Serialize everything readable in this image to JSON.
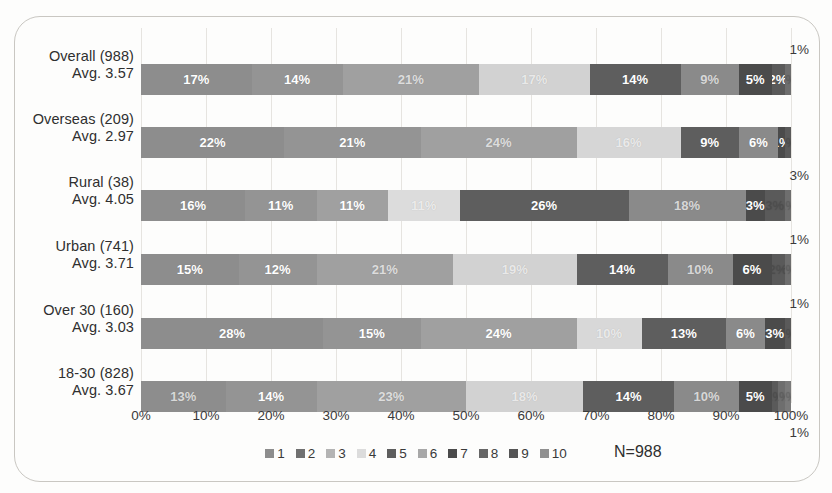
{
  "chart_data": {
    "type": "bar",
    "subtype": "100% stacked horizontal bar",
    "title": "",
    "xlabel": "",
    "ylabel": "",
    "xlim": [
      0,
      100
    ],
    "xticks": [
      "0%",
      "10%",
      "20%",
      "30%",
      "40%",
      "50%",
      "60%",
      "70%",
      "80%",
      "90%",
      "100%"
    ],
    "grid": true,
    "legend_position": "bottom-center",
    "legend": [
      "1",
      "2",
      "3",
      "4",
      "5",
      "6",
      "7",
      "8",
      "9",
      "10"
    ],
    "annotation": "N=988",
    "categories": [
      "Overall (988)",
      "Overseas (209)",
      "Rural (38)",
      "Urban (741)",
      "Over 30 (160)",
      "18-30  (828)"
    ],
    "series": [
      {
        "name": "1",
        "values": [
          17,
          22,
          16,
          15,
          28,
          13
        ]
      },
      {
        "name": "2",
        "values": [
          14,
          21,
          11,
          12,
          15,
          14
        ]
      },
      {
        "name": "3",
        "values": [
          21,
          24,
          11,
          21,
          24,
          23
        ]
      },
      {
        "name": "4",
        "values": [
          17,
          16,
          11,
          19,
          10,
          18
        ]
      },
      {
        "name": "5",
        "values": [
          14,
          9,
          26,
          14,
          13,
          14
        ]
      },
      {
        "name": "6",
        "values": [
          9,
          6,
          18,
          10,
          6,
          10
        ]
      },
      {
        "name": "7",
        "values": [
          5,
          1,
          3,
          6,
          3,
          5
        ]
      },
      {
        "name": "8",
        "values": [
          2,
          1,
          3,
          2,
          1,
          1
        ]
      },
      {
        "name": "9",
        "values": [
          1,
          0,
          0,
          1,
          0,
          1
        ]
      },
      {
        "name": "10",
        "values": [
          0,
          0,
          1,
          0,
          0,
          1
        ]
      }
    ]
  },
  "rows": [
    {
      "label_line1": "Overall (988)",
      "label_line2": "Avg. 3.57",
      "callout": "1%",
      "callout_position": "above",
      "segments": [
        {
          "value": 17,
          "label": "17%",
          "color": "#8d8d8d",
          "label_style": "normal"
        },
        {
          "value": 14,
          "label": "14%",
          "color": "#949494",
          "label_style": "normal"
        },
        {
          "value": 21,
          "label": "21%",
          "color": "#a0a0a0",
          "label_style": "faint"
        },
        {
          "value": 17,
          "label": "17%",
          "color": "#d2d2d2",
          "label_style": "faint"
        },
        {
          "value": 14,
          "label": "14%",
          "color": "#5e5e5e",
          "label_style": "normal"
        },
        {
          "value": 9,
          "label": "9%",
          "color": "#8a8a8a",
          "label_style": "faint"
        },
        {
          "value": 5,
          "label": "5%",
          "color": "#4b4b4b",
          "label_style": "normal"
        },
        {
          "value": 2,
          "label": "2%",
          "color": "#5a5a5a",
          "label_style": "normal"
        },
        {
          "value": 1,
          "label": "1%",
          "color": "#6e6e6e",
          "label_style": "hidden"
        }
      ]
    },
    {
      "label_line1": "Overseas (209)",
      "label_line2": "Avg. 2.97",
      "callout": "",
      "callout_position": "none",
      "segments": [
        {
          "value": 22,
          "label": "22%",
          "color": "#8d8d8d",
          "label_style": "normal"
        },
        {
          "value": 21,
          "label": "21%",
          "color": "#949494",
          "label_style": "normal"
        },
        {
          "value": 24,
          "label": "24%",
          "color": "#a0a0a0",
          "label_style": "faint"
        },
        {
          "value": 16,
          "label": "16%",
          "color": "#d6d6d6",
          "label_style": "faint"
        },
        {
          "value": 9,
          "label": "9%",
          "color": "#5e5e5e",
          "label_style": "normal"
        },
        {
          "value": 6,
          "label": "6%",
          "color": "#8a8a8a",
          "label_style": "normal"
        },
        {
          "value": 1,
          "label": "1%",
          "color": "#4b4b4b",
          "label_style": "normal"
        },
        {
          "value": 1,
          "label": "1%",
          "color": "#5a5a5a",
          "label_style": "hidden"
        }
      ]
    },
    {
      "label_line1": "Rural (38)",
      "label_line2": "Avg. 4.05",
      "callout": "3%",
      "callout_position": "above",
      "segments": [
        {
          "value": 16,
          "label": "16%",
          "color": "#8d8d8d",
          "label_style": "normal"
        },
        {
          "value": 11,
          "label": "11%",
          "color": "#949494",
          "label_style": "normal"
        },
        {
          "value": 11,
          "label": "11%",
          "color": "#a0a0a0",
          "label_style": "normal"
        },
        {
          "value": 11,
          "label": "11%",
          "color": "#dcdcdc",
          "label_style": "faint"
        },
        {
          "value": 26,
          "label": "26%",
          "color": "#5e5e5e",
          "label_style": "normal"
        },
        {
          "value": 18,
          "label": "18%",
          "color": "#8a8a8a",
          "label_style": "faint"
        },
        {
          "value": 3,
          "label": "3%",
          "color": "#4b4b4b",
          "label_style": "normal"
        },
        {
          "value": 3,
          "label": "3%",
          "color": "#5a5a5a",
          "label_style": "hidden"
        },
        {
          "value": 1,
          "label": "1%",
          "color": "#6e6e6e",
          "label_style": "hidden"
        }
      ]
    },
    {
      "label_line1": "Urban (741)",
      "label_line2": "Avg. 3.71",
      "callout": "1%",
      "callout_position": "above",
      "segments": [
        {
          "value": 15,
          "label": "15%",
          "color": "#8d8d8d",
          "label_style": "normal"
        },
        {
          "value": 12,
          "label": "12%",
          "color": "#949494",
          "label_style": "normal"
        },
        {
          "value": 21,
          "label": "21%",
          "color": "#a0a0a0",
          "label_style": "faint"
        },
        {
          "value": 19,
          "label": "19%",
          "color": "#d2d2d2",
          "label_style": "faint"
        },
        {
          "value": 14,
          "label": "14%",
          "color": "#5e5e5e",
          "label_style": "normal"
        },
        {
          "value": 10,
          "label": "10%",
          "color": "#8a8a8a",
          "label_style": "faint"
        },
        {
          "value": 6,
          "label": "6%",
          "color": "#4b4b4b",
          "label_style": "normal"
        },
        {
          "value": 2,
          "label": "2%",
          "color": "#5a5a5a",
          "label_style": "hidden"
        },
        {
          "value": 1,
          "label": "1%",
          "color": "#6e6e6e",
          "label_style": "hidden"
        }
      ]
    },
    {
      "label_line1": "Over 30 (160)",
      "label_line2": "Avg. 3.03",
      "callout": "1%",
      "callout_position": "above",
      "segments": [
        {
          "value": 28,
          "label": "28%",
          "color": "#8d8d8d",
          "label_style": "normal"
        },
        {
          "value": 15,
          "label": "15%",
          "color": "#949494",
          "label_style": "normal"
        },
        {
          "value": 24,
          "label": "24%",
          "color": "#a0a0a0",
          "label_style": "normal"
        },
        {
          "value": 10,
          "label": "10%",
          "color": "#d8d8d8",
          "label_style": "faint"
        },
        {
          "value": 13,
          "label": "13%",
          "color": "#5e5e5e",
          "label_style": "normal"
        },
        {
          "value": 6,
          "label": "6%",
          "color": "#8a8a8a",
          "label_style": "normal"
        },
        {
          "value": 3,
          "label": "3%",
          "color": "#4b4b4b",
          "label_style": "normal"
        },
        {
          "value": 1,
          "label": "1%",
          "color": "#5a5a5a",
          "label_style": "hidden"
        }
      ]
    },
    {
      "label_line1": "18-30  (828)",
      "label_line2": "Avg. 3.67",
      "callout": "1%",
      "callout_position": "below",
      "segments": [
        {
          "value": 13,
          "label": "13%",
          "color": "#8d8d8d",
          "label_style": "faint"
        },
        {
          "value": 14,
          "label": "14%",
          "color": "#949494",
          "label_style": "normal"
        },
        {
          "value": 23,
          "label": "23%",
          "color": "#a0a0a0",
          "label_style": "faint"
        },
        {
          "value": 18,
          "label": "18%",
          "color": "#d2d2d2",
          "label_style": "faint"
        },
        {
          "value": 14,
          "label": "14%",
          "color": "#5e5e5e",
          "label_style": "normal"
        },
        {
          "value": 10,
          "label": "10%",
          "color": "#8a8a8a",
          "label_style": "faint"
        },
        {
          "value": 5,
          "label": "5%",
          "color": "#4b4b4b",
          "label_style": "normal"
        },
        {
          "value": 1,
          "label": "1%",
          "color": "#5a5a5a",
          "label_style": "hidden"
        },
        {
          "value": 1,
          "label": "1%",
          "color": "#6e6e6e",
          "label_style": "hidden"
        },
        {
          "value": 1,
          "label": "1%",
          "color": "#7a7a7a",
          "label_style": "hidden"
        }
      ]
    }
  ],
  "legend": {
    "items": [
      {
        "label": "1",
        "color": "#8d8d8d"
      },
      {
        "label": "2",
        "color": "#707070"
      },
      {
        "label": "3",
        "color": "#b4b4b4"
      },
      {
        "label": "4",
        "color": "#dcdcdc"
      },
      {
        "label": "5",
        "color": "#5e5e5e"
      },
      {
        "label": "6",
        "color": "#a8a8a8"
      },
      {
        "label": "7",
        "color": "#4b4b4b"
      },
      {
        "label": "8",
        "color": "#666666"
      },
      {
        "label": "9",
        "color": "#555555"
      },
      {
        "label": "10",
        "color": "#909090"
      }
    ]
  },
  "axis": {
    "ticks": [
      "0%",
      "10%",
      "20%",
      "30%",
      "40%",
      "50%",
      "60%",
      "70%",
      "80%",
      "90%",
      "100%"
    ]
  },
  "footnote": "N=988"
}
